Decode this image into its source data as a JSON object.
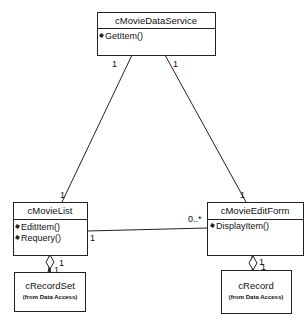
{
  "diagram": {
    "type": "UML class diagram",
    "classes": {
      "data_service": {
        "name": "cMovieDataService",
        "operations": [
          "GetItem()"
        ]
      },
      "movie_list": {
        "name": "cMovieList",
        "operations": [
          "EditItem()",
          "Requery()"
        ]
      },
      "edit_form": {
        "name": "cMovieEditForm",
        "operations": [
          "DisplayItem()"
        ]
      },
      "record_set": {
        "name": "cRecordSet",
        "package": "(from Data Access)"
      },
      "record": {
        "name": "cRecord",
        "package": "(from Data Access)"
      }
    },
    "associations": {
      "service_list": {
        "from": "cMovieDataService",
        "to": "cMovieList",
        "from_mult": "1",
        "to_mult": "1"
      },
      "service_form": {
        "from": "cMovieDataService",
        "to": "cMovieEditForm",
        "from_mult": "1",
        "to_mult": "1"
      },
      "list_form": {
        "from": "cMovieList",
        "to": "cMovieEditForm",
        "from_mult": "1",
        "to_mult": "0..*"
      },
      "list_recordset": {
        "from": "cMovieList",
        "to": "cRecordSet",
        "kind": "aggregation",
        "from_mult": "1",
        "to_mult": "1"
      },
      "form_record": {
        "from": "cMovieEditForm",
        "to": "cRecord",
        "kind": "aggregation",
        "from_mult": "1",
        "to_mult": "1"
      }
    },
    "colors": {
      "line": "#222222",
      "background": "#ffffff",
      "text": "#111111"
    }
  }
}
